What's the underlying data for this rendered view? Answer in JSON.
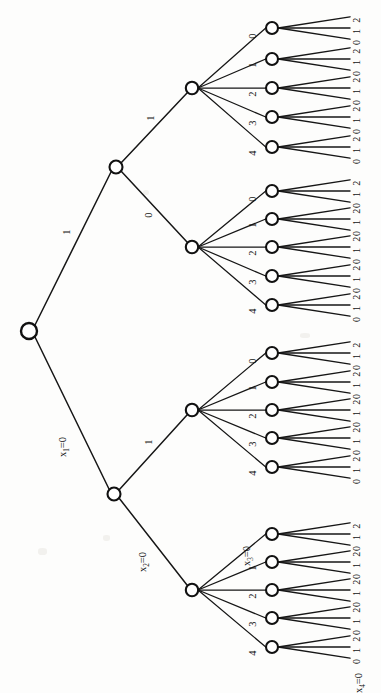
{
  "diagram": {
    "type": "rotated-tree",
    "orientation": "left-to-right, labels rotated 90 degrees",
    "ink_color": "#161616",
    "node_fill": "#ffffff",
    "background": "#fdfdfc"
  },
  "levels": [
    {
      "variable": "x_1",
      "branch_count": 2,
      "branch_labels": [
        "x₁=0",
        "1"
      ]
    },
    {
      "variable": "x_2",
      "branch_count": 2,
      "branch_labels": [
        "x₂=0",
        "1"
      ]
    },
    {
      "variable": "x_3",
      "branch_count": 5,
      "branch_labels": [
        "x₃=0",
        "1",
        "2",
        "3",
        "4"
      ]
    },
    {
      "variable": "x_4",
      "branch_count": 3,
      "branch_labels": [
        "x₄=0",
        "1",
        "2"
      ]
    }
  ],
  "variable_labels": {
    "x1": {
      "base": "x",
      "sub": "1",
      "eq": "=0"
    },
    "x2": {
      "base": "x",
      "sub": "2",
      "eq": "=0"
    },
    "x3": {
      "base": "x",
      "sub": "3",
      "eq": "=0"
    },
    "x4": {
      "base": "x",
      "sub": "4",
      "eq": "=0"
    }
  },
  "edge_labels": {
    "level1_top": "1",
    "level1_bottom_var": "x₁=0",
    "level2_top": "1",
    "level2_bottom": "0",
    "level2_lower_top": "1",
    "level2_lower_bottom_var": "x₂=0",
    "level3_set": [
      "0",
      "1",
      "2",
      "3",
      "4"
    ],
    "level3_lowest_first_var": "x₃=0",
    "level4_set": [
      "0",
      "1",
      "2"
    ],
    "level4_lowest_first_var": "x₄=0"
  },
  "nodes": {
    "root": {
      "name": "root",
      "cx": 29,
      "cy": 331,
      "r": 8
    },
    "level1": [
      {
        "name": "n-x1-1",
        "cx": 116,
        "cy": 167,
        "r": 6.5
      },
      {
        "name": "n-x1-0",
        "cx": 114,
        "cy": 494,
        "r": 6.5
      }
    ],
    "level2": [
      {
        "name": "n-g1",
        "cx": 192,
        "cy": 88,
        "r": 6.2
      },
      {
        "name": "n-g2",
        "cx": 192,
        "cy": 247,
        "r": 6.2
      },
      {
        "name": "n-g3",
        "cx": 192,
        "cy": 410,
        "r": 6.2
      },
      {
        "name": "n-g4",
        "cx": 192,
        "cy": 590,
        "r": 6.2
      }
    ],
    "level3_groups": [
      {
        "group": 1,
        "cx": 272,
        "cys": [
          28,
          59,
          88,
          117,
          147
        ]
      },
      {
        "group": 2,
        "cx": 272,
        "cys": [
          191,
          219,
          247,
          276,
          305
        ]
      },
      {
        "group": 3,
        "cx": 272,
        "cys": [
          353,
          382,
          410,
          438,
          467
        ]
      },
      {
        "group": 4,
        "cx": 272,
        "cys": [
          534,
          562,
          590,
          618,
          647
        ]
      }
    ]
  },
  "leaf_digit_sequence": [
    "0",
    "1",
    "2"
  ],
  "leaf_column_x": 356,
  "counts": {
    "total_leaf_branches": 60,
    "level3_nodes": 20,
    "level2_nodes": 4,
    "level1_nodes": 2
  }
}
